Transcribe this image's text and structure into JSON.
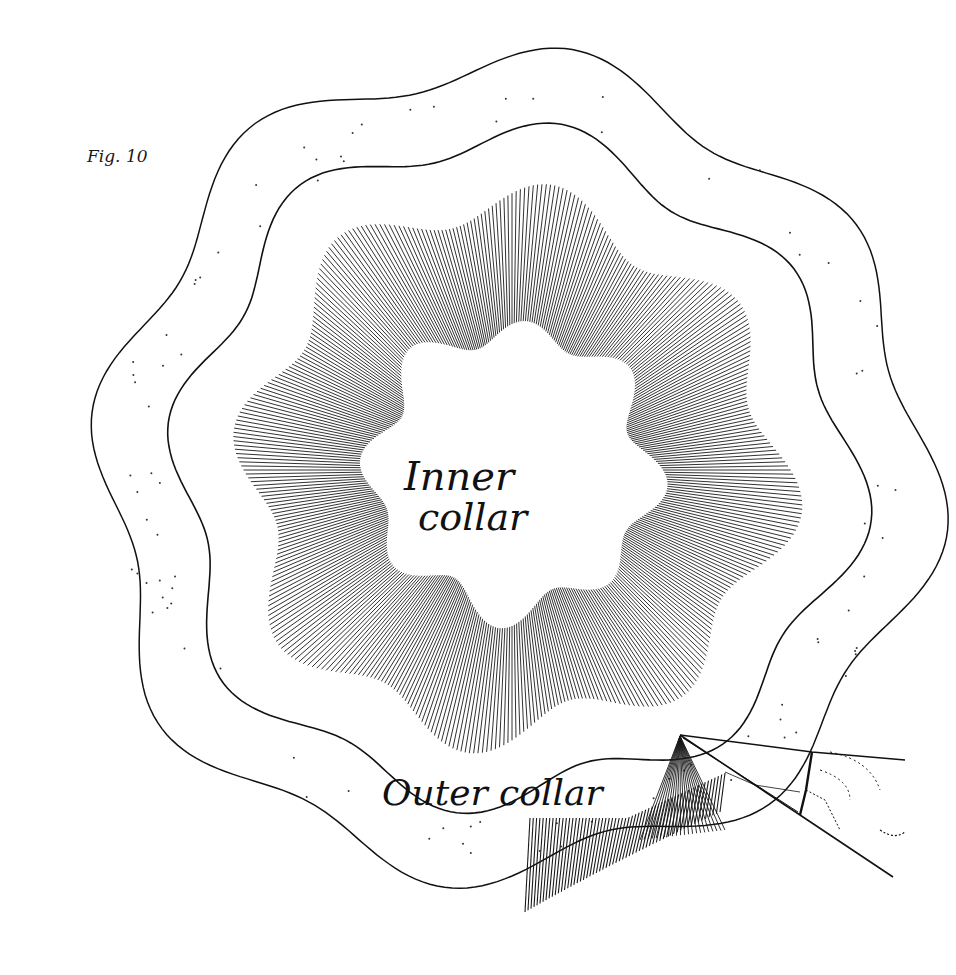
{
  "figure": {
    "label": "Fig. 10",
    "inner_label_line1": "Inner",
    "inner_label_line2": "collar",
    "outer_label": "Outer collar"
  },
  "colors": {
    "background": "#ffffff",
    "ink": "#111111"
  },
  "geometry": {
    "center": [
      512,
      470
    ],
    "lobes": 8,
    "outer_boundary_radius": 410,
    "middle_boundary_radius": 335,
    "hatch_outer_radius": 265,
    "hatch_inner_radius": 140
  }
}
